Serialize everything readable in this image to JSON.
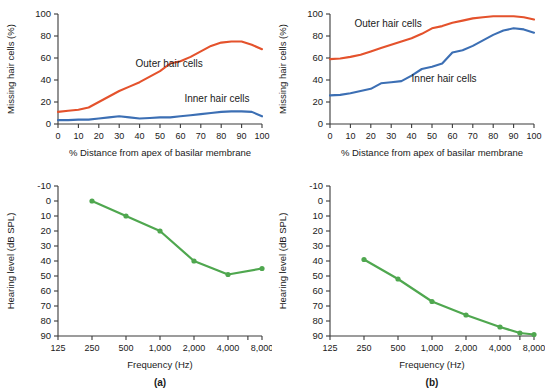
{
  "figure": {
    "panel_labels": [
      "(a)",
      "(b)"
    ]
  },
  "colors": {
    "outer_hair_cells": "#E4522C",
    "inner_hair_cells": "#3C6FB4",
    "audiogram": "#4FA74F",
    "axis": "#3a3a3a",
    "text": "#1a1a1a",
    "background": "#ffffff"
  },
  "chart_data": [
    {
      "id": "panel-a-top",
      "type": "line",
      "title": "",
      "xlabel": "% Distance from apex of basilar membrane",
      "ylabel": "Missing hair cells (%)",
      "xlim": [
        0,
        100
      ],
      "ylim": [
        0,
        100
      ],
      "xticks": [
        0,
        10,
        20,
        30,
        40,
        50,
        60,
        70,
        80,
        90,
        100
      ],
      "xticklabels": [
        "0",
        "10",
        "20",
        "30",
        "40",
        "50",
        "60",
        "70",
        "80",
        "90",
        "100"
      ],
      "yticks": [
        0,
        20,
        40,
        60,
        80,
        100
      ],
      "yticklabels": [
        "0",
        "20",
        "40",
        "60",
        "80",
        "100"
      ],
      "grid": false,
      "legend": "inline-annotations",
      "annotations": [
        {
          "text": "Outer hair cells",
          "x": 38,
          "y": 52
        },
        {
          "text": "Inner hair cells",
          "x": 62,
          "y": 20
        }
      ],
      "x": [
        0,
        5,
        10,
        15,
        20,
        25,
        30,
        35,
        40,
        45,
        50,
        55,
        60,
        65,
        70,
        75,
        80,
        85,
        90,
        95,
        100
      ],
      "series": [
        {
          "name": "Outer hair cells",
          "color": "#E4522C",
          "values": [
            11,
            12,
            13,
            15,
            20,
            25,
            30,
            34,
            38,
            43,
            48,
            55,
            57,
            61,
            66,
            71,
            74,
            75,
            75,
            72,
            68
          ]
        },
        {
          "name": "Inner hair cells",
          "color": "#3C6FB4",
          "values": [
            3.5,
            3.5,
            4,
            4,
            5,
            6,
            7,
            6,
            5,
            5.5,
            6,
            6,
            7,
            8,
            9,
            10,
            11,
            11.5,
            11.5,
            11,
            7
          ]
        }
      ]
    },
    {
      "id": "panel-b-top",
      "type": "line",
      "title": "",
      "xlabel": "% Distance from apex of basilar membrane",
      "ylabel": "Missing hair cells (%)",
      "xlim": [
        0,
        100
      ],
      "ylim": [
        0,
        100
      ],
      "xticks": [
        0,
        10,
        20,
        30,
        40,
        50,
        60,
        70,
        80,
        90,
        100
      ],
      "xticklabels": [
        "0",
        "10",
        "20",
        "30",
        "40",
        "50",
        "60",
        "70",
        "80",
        "90",
        "100"
      ],
      "yticks": [
        0,
        20,
        40,
        60,
        80,
        100
      ],
      "yticklabels": [
        "0",
        "20",
        "40",
        "60",
        "80",
        "100"
      ],
      "grid": false,
      "legend": "inline-annotations",
      "annotations": [
        {
          "text": "Outer hair cells",
          "x": 12,
          "y": 88
        },
        {
          "text": "Inner hair cells",
          "x": 40,
          "y": 38
        }
      ],
      "x": [
        0,
        5,
        10,
        15,
        20,
        25,
        30,
        35,
        40,
        45,
        50,
        55,
        60,
        65,
        70,
        75,
        80,
        85,
        90,
        95,
        100
      ],
      "series": [
        {
          "name": "Outer hair cells",
          "color": "#E4522C",
          "values": [
            59,
            59.5,
            61,
            63,
            66,
            69,
            72,
            75,
            78,
            82,
            87,
            89,
            92,
            94,
            96,
            97,
            98,
            98,
            98,
            97,
            95
          ]
        },
        {
          "name": "Inner hair cells",
          "color": "#3C6FB4",
          "values": [
            26,
            26.5,
            28,
            30,
            32,
            37,
            38,
            39,
            44,
            50,
            52,
            55,
            65,
            67,
            71,
            76,
            81,
            85,
            87,
            86,
            83
          ]
        }
      ]
    },
    {
      "id": "panel-a-bottom",
      "type": "line",
      "title": "",
      "xlabel": "Frequency (Hz)",
      "ylabel": "Hearing level (dB SPL)",
      "xscale": "log",
      "xlim": [
        125,
        8000
      ],
      "ylim": [
        -10,
        90
      ],
      "y_inverted": true,
      "xticks": [
        125,
        250,
        500,
        1000,
        2000,
        4000,
        6000,
        8000
      ],
      "xticklabels": [
        "125",
        "250",
        "500",
        "1,000",
        "2,000",
        "4,000",
        "",
        "8,000"
      ],
      "yticks": [
        -10,
        0,
        10,
        20,
        30,
        40,
        50,
        60,
        70,
        80,
        90
      ],
      "yticklabels": [
        "-10",
        "0",
        "10",
        "20",
        "30",
        "40",
        "50",
        "60",
        "70",
        "80",
        "90"
      ],
      "grid": false,
      "markers": true,
      "x": [
        250,
        500,
        1000,
        2000,
        4000,
        8000
      ],
      "values": [
        0,
        10,
        20,
        40,
        49,
        45
      ],
      "color": "#4FA74F"
    },
    {
      "id": "panel-b-bottom",
      "type": "line",
      "title": "",
      "xlabel": "Frequency (Hz)",
      "ylabel": "Hearing level (dB SPL)",
      "xscale": "log",
      "xlim": [
        125,
        8000
      ],
      "ylim": [
        -10,
        90
      ],
      "y_inverted": true,
      "xticks": [
        125,
        250,
        500,
        1000,
        2000,
        4000,
        6000,
        8000
      ],
      "xticklabels": [
        "125",
        "250",
        "500",
        "1,000",
        "2,000",
        "4,000",
        "",
        "8,000"
      ],
      "yticks": [
        -10,
        0,
        10,
        20,
        30,
        40,
        50,
        60,
        70,
        80,
        90
      ],
      "yticklabels": [
        "-10",
        "0",
        "10",
        "20",
        "30",
        "40",
        "50",
        "60",
        "70",
        "80",
        "90"
      ],
      "grid": false,
      "markers": true,
      "x": [
        250,
        500,
        1000,
        2000,
        4000,
        6000,
        8000
      ],
      "values": [
        39,
        52,
        67,
        76,
        84,
        88,
        89
      ],
      "color": "#4FA74F"
    }
  ]
}
